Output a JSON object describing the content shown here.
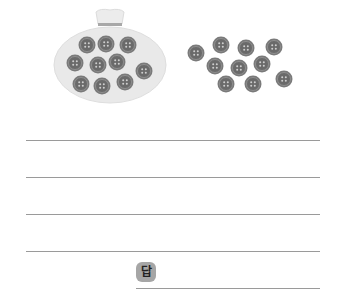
{
  "figure": {
    "pouch": {
      "label": "pouch-with-buttons",
      "buttons_count": 10,
      "buttons": [
        [
          87,
          45
        ],
        [
          106,
          44
        ],
        [
          128,
          45
        ],
        [
          75,
          63
        ],
        [
          98,
          65
        ],
        [
          117,
          62
        ],
        [
          144,
          71
        ],
        [
          81,
          84
        ],
        [
          102,
          86
        ],
        [
          125,
          82
        ]
      ]
    },
    "loose_buttons": {
      "count": 10,
      "buttons": [
        [
          196,
          53
        ],
        [
          221,
          45
        ],
        [
          246,
          48
        ],
        [
          274,
          47
        ],
        [
          215,
          66
        ],
        [
          239,
          68
        ],
        [
          262,
          64
        ],
        [
          226,
          84
        ],
        [
          253,
          84
        ],
        [
          284,
          79
        ]
      ]
    },
    "colors": {
      "button_fill": "#6e6e6e",
      "button_rim": "#8a8a8a",
      "pouch_fill": "#e9e9e9",
      "pouch_neck_band": "#a8a8a8"
    }
  },
  "writing_lines": [
    140,
    177,
    214,
    251
  ],
  "answer": {
    "label": "답",
    "value": ""
  }
}
